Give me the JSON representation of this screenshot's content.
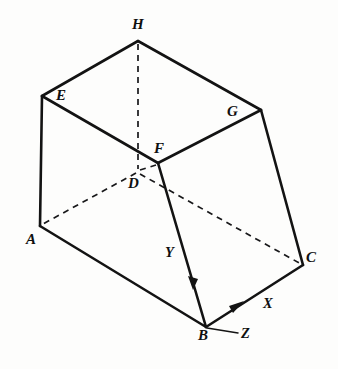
{
  "figure": {
    "background_color": "#fdfdfc",
    "line_color": "#131313",
    "canvas": {
      "width": 338,
      "height": 369
    }
  },
  "vertices": [
    {
      "id": "H",
      "label": "H",
      "x": 138,
      "y": 41,
      "label_x": 132,
      "label_y": 17,
      "hidden": false
    },
    {
      "id": "E",
      "label": "E",
      "x": 42,
      "y": 96,
      "label_x": 56,
      "label_y": 88,
      "hidden": false
    },
    {
      "id": "G",
      "label": "G",
      "x": 261,
      "y": 110,
      "label_x": 227,
      "label_y": 104,
      "hidden": false
    },
    {
      "id": "F",
      "label": "F",
      "x": 158,
      "y": 163,
      "label_x": 154,
      "label_y": 141,
      "hidden": false
    },
    {
      "id": "D",
      "label": "D",
      "x": 138,
      "y": 172,
      "label_x": 128,
      "label_y": 176,
      "hidden": true
    },
    {
      "id": "A",
      "label": "A",
      "x": 40,
      "y": 226,
      "label_x": 26,
      "label_y": 232,
      "hidden": false
    },
    {
      "id": "C",
      "label": "C",
      "x": 303,
      "y": 265,
      "label_x": 306,
      "label_y": 250,
      "hidden": false
    },
    {
      "id": "B",
      "label": "B",
      "x": 206,
      "y": 327,
      "label_x": 198,
      "label_y": 328,
      "hidden": false
    }
  ],
  "edges_solid": [
    {
      "id": "EH",
      "from": "E",
      "to": "H"
    },
    {
      "id": "HG",
      "from": "H",
      "to": "G"
    },
    {
      "id": "EF",
      "from": "E",
      "to": "F"
    },
    {
      "id": "FG",
      "from": "F",
      "to": "G"
    },
    {
      "id": "EA",
      "from": "E",
      "to": "A"
    },
    {
      "id": "GC",
      "from": "G",
      "to": "C"
    },
    {
      "id": "AB",
      "from": "A",
      "to": "B"
    },
    {
      "id": "BC",
      "from": "B",
      "to": "C"
    },
    {
      "id": "FB",
      "from": "F",
      "to": "B"
    }
  ],
  "edges_hidden": [
    {
      "id": "HD",
      "from": "H",
      "to": "D"
    },
    {
      "id": "DA",
      "from": "D",
      "to": "A"
    },
    {
      "id": "DC",
      "from": "D",
      "to": "C"
    },
    {
      "id": "DF",
      "from": "D",
      "to": "F"
    }
  ],
  "axes": [
    {
      "id": "X",
      "label": "X",
      "origin": "B",
      "direction_to": "C",
      "label_x": 263,
      "label_y": 296,
      "arrow_at": {
        "x": 236,
        "y": 306
      }
    },
    {
      "id": "Y",
      "label": "Y",
      "origin": "F",
      "direction_to": "B",
      "label_x": 165,
      "label_y": 245,
      "arrow_at": {
        "x": 192,
        "y": 283
      }
    },
    {
      "id": "Z",
      "label": "Z",
      "origin": "B",
      "direction_to": "ZEND",
      "label_x": 241,
      "label_y": 326,
      "arrow_at": null,
      "end": {
        "x": 238,
        "y": 333
      }
    }
  ]
}
